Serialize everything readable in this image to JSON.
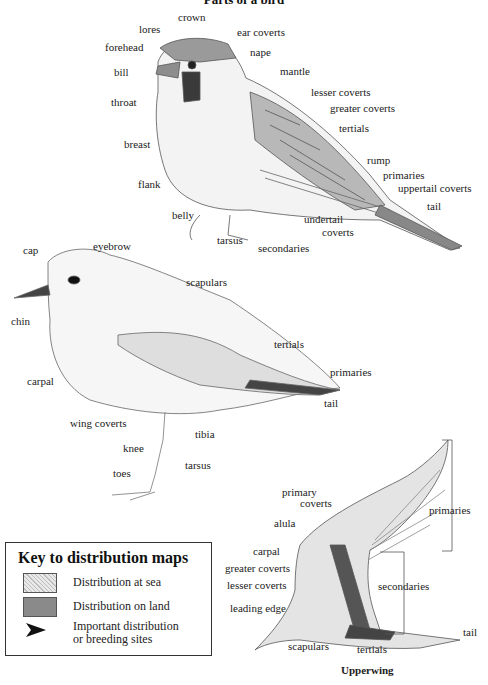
{
  "title": "Parts of a bird",
  "sparrow": {
    "labels": {
      "crown": "crown",
      "lores": "lores",
      "forehead": "forehead",
      "bill": "bill",
      "throat": "throat",
      "ear_coverts": "ear coverts",
      "nape": "nape",
      "mantle": "mantle",
      "lesser_coverts": "lesser coverts",
      "greater_coverts": "greater coverts",
      "tertials": "tertials",
      "breast": "breast",
      "rump": "rump",
      "primaries": "primaries",
      "uppertail_coverts": "uppertail coverts",
      "flank": "flank",
      "tail": "tail",
      "belly": "belly",
      "undertail_coverts_1": "undertail",
      "undertail_coverts_2": "coverts",
      "tarsus": "tarsus",
      "secondaries": "secondaries"
    }
  },
  "plover": {
    "labels": {
      "cap": "cap",
      "eyebrow": "eyebrow",
      "chin": "chin",
      "scapulars": "scapulars",
      "carpal": "carpal",
      "tertials": "tertials",
      "primaries": "primaries",
      "tail": "tail",
      "wing_coverts": "wing coverts",
      "tibia": "tibia",
      "knee": "knee",
      "tarsus": "tarsus",
      "toes": "toes"
    }
  },
  "upperwing": {
    "title": "Upperwing",
    "labels": {
      "primary_coverts_1": "primary",
      "primary_coverts_2": "coverts",
      "alula": "alula",
      "primaries": "primaries",
      "carpal": "carpal",
      "greater_coverts": "greater coverts",
      "lesser_coverts": "lesser coverts",
      "secondaries": "secondaries",
      "leading_edge": "leading edge",
      "tail": "tail",
      "scapulars": "scapulars",
      "tertials": "tertials"
    }
  },
  "key": {
    "title": "Key to distribution maps",
    "items": [
      {
        "swatch": "hatched-light",
        "label": "Distribution at sea"
      },
      {
        "swatch": "solid-dark",
        "label": "Distribution on land"
      },
      {
        "swatch": "arrowhead",
        "label_1": "Important distribution",
        "label_2": "or breeding sites"
      }
    ]
  }
}
